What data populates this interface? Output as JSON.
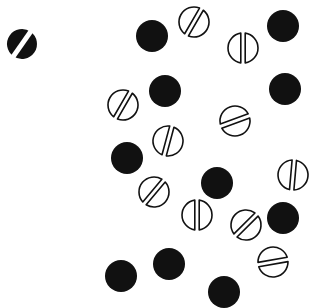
{
  "figure": {
    "width": 310,
    "height": 308,
    "background": "#ffffff",
    "ink": "#111111",
    "radius": 16
  },
  "marked_circle": {
    "x": 22,
    "y": 44,
    "angle": -55,
    "kind": "filled-slashed"
  },
  "filled_circles": [
    {
      "x": 152,
      "y": 36
    },
    {
      "x": 283,
      "y": 26
    },
    {
      "x": 165,
      "y": 91
    },
    {
      "x": 285,
      "y": 89
    },
    {
      "x": 127,
      "y": 158
    },
    {
      "x": 217,
      "y": 183
    },
    {
      "x": 283,
      "y": 218
    },
    {
      "x": 121,
      "y": 276
    },
    {
      "x": 169,
      "y": 264
    },
    {
      "x": 224,
      "y": 292
    }
  ],
  "split_circles": [
    {
      "x": 194,
      "y": 22,
      "angle": 30
    },
    {
      "x": 243,
      "y": 48,
      "angle": 0
    },
    {
      "x": 123,
      "y": 105,
      "angle": 30
    },
    {
      "x": 168,
      "y": 141,
      "angle": 15
    },
    {
      "x": 235,
      "y": 121,
      "angle": 70
    },
    {
      "x": 154,
      "y": 192,
      "angle": 40
    },
    {
      "x": 197,
      "y": 215,
      "angle": 0
    },
    {
      "x": 246,
      "y": 225,
      "angle": 45
    },
    {
      "x": 293,
      "y": 175,
      "angle": 5
    },
    {
      "x": 273,
      "y": 262,
      "angle": 80
    }
  ]
}
